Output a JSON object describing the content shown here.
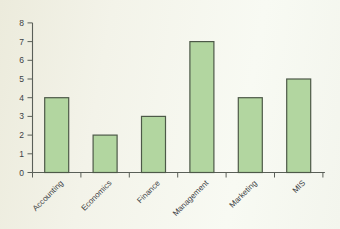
{
  "chart_data": {
    "type": "bar",
    "categories": [
      "Accounting",
      "Economics",
      "Finance",
      "Management",
      "Marketing",
      "MIS"
    ],
    "values": [
      4,
      2,
      3,
      7,
      4,
      5
    ],
    "title": "",
    "xlabel": "",
    "ylabel": "",
    "ylim": [
      0,
      8
    ],
    "yticks": [
      0,
      1,
      2,
      3,
      4,
      5,
      6,
      7,
      8
    ],
    "grid": false,
    "legend_position": "none",
    "x_tick_style": "category-boundaries",
    "category_label_rotation": -45,
    "colors": {
      "bar_fill": "#b2d6a0",
      "bar_border": "#4d5948",
      "axis": "#5a5f58",
      "tick_text": "#3c4145",
      "paper_background": "#f3f3e9"
    }
  }
}
